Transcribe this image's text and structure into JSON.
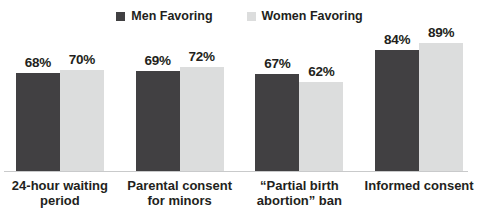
{
  "legend": {
    "entries": [
      {
        "label": "Men Favoring",
        "color": "#414042",
        "icon": "legend-swatch-square"
      },
      {
        "label": "Women Favoring",
        "color": "#dcdddd",
        "icon": "legend-swatch-square"
      }
    ]
  },
  "chart_data": {
    "type": "bar",
    "title": "",
    "subtitle": "",
    "xlabel": "",
    "ylabel": "",
    "ylim": [
      0,
      100
    ],
    "grid": false,
    "legend_position": "top-center",
    "value_suffix": "%",
    "categories": [
      "24-hour waiting period",
      "Parental consent for minors",
      "“Partial birth abortion” ban",
      "Informed consent"
    ],
    "series": [
      {
        "name": "Men Favoring",
        "color": "#414042",
        "values": [
          68,
          69,
          67,
          84
        ]
      },
      {
        "name": "Women Favoring",
        "color": "#dcdddd",
        "values": [
          70,
          72,
          62,
          89
        ]
      }
    ],
    "data_labels": [
      {
        "category": "24-hour waiting period",
        "men": "68%",
        "women": "70%"
      },
      {
        "category": "Parental consent for minors",
        "men": "69%",
        "women": "72%"
      },
      {
        "category": "“Partial birth abortion” ban",
        "men": "67%",
        "women": "62%"
      },
      {
        "category": "Informed consent",
        "men": "84%",
        "women": "89%"
      }
    ]
  }
}
